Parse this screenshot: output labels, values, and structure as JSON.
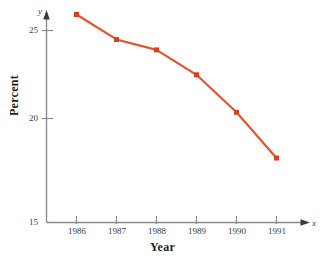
{
  "chart_data": {
    "type": "line",
    "title": "",
    "subtitle": "",
    "xlabel": "Year",
    "ylabel": "Percent",
    "x_axis_variable": "x",
    "y_axis_variable": "y",
    "categories": [
      "1986",
      "1987",
      "1988",
      "1989",
      "1990",
      "1991"
    ],
    "x": [
      1986,
      1987,
      1988,
      1989,
      1990,
      1991
    ],
    "values": [
      25.0,
      23.8,
      23.3,
      22.1,
      20.3,
      18.1
    ],
    "series": [
      {
        "name": "Percent",
        "values": [
          25.0,
          23.8,
          23.3,
          22.1,
          20.3,
          18.1
        ]
      }
    ],
    "xlim": [
      1985.3,
      1991.9
    ],
    "ylim": [
      15,
      25.6
    ],
    "y_ticks": [
      15,
      20,
      25
    ],
    "y_tick_labels": [
      "15",
      "20",
      "25"
    ],
    "x_ticks": [
      1986,
      1987,
      1988,
      1989,
      1990,
      1991
    ],
    "x_tick_labels": [
      "1986",
      "1987",
      "1988",
      "1989",
      "1990",
      "1991"
    ],
    "grid": false,
    "legend": false,
    "legend_position": "none",
    "marker": "square",
    "line_color": "#E8502A",
    "marker_color": "#D8401C",
    "axis_color": "#8b8b8b",
    "text_color": "#231f20",
    "annotations": []
  },
  "axes": {
    "y_axis_variable_label": "y",
    "x_axis_variable_label": "x",
    "y_title": "Percent",
    "x_title": "Year",
    "y_tick_labels": [
      "25",
      "20",
      "15"
    ],
    "x_tick_labels": [
      "1986",
      "1987",
      "1988",
      "1989",
      "1990",
      "1991"
    ]
  }
}
